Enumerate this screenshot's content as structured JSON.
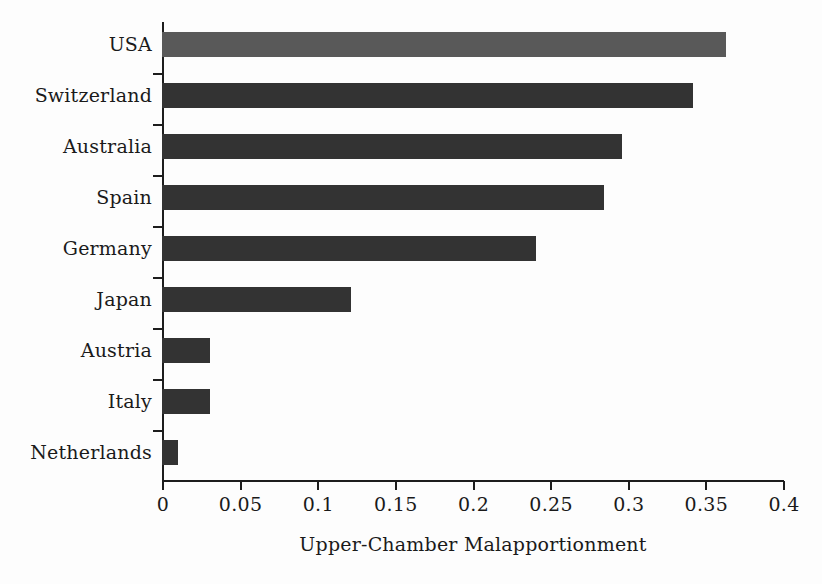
{
  "chart_data": {
    "type": "bar",
    "orientation": "horizontal",
    "title": "",
    "xlabel": "Upper-Chamber Malapportionment",
    "ylabel": "",
    "categories": [
      "USA",
      "Switzerland",
      "Australia",
      "Spain",
      "Germany",
      "Japan",
      "Austria",
      "Italy",
      "Netherlands"
    ],
    "values": [
      0.363,
      0.342,
      0.296,
      0.285,
      0.241,
      0.122,
      0.031,
      0.031,
      0.01
    ],
    "series": [
      {
        "name": "Upper-Chamber Malapportionment",
        "values": [
          0.363,
          0.342,
          0.296,
          0.285,
          0.241,
          0.122,
          0.031,
          0.031,
          0.01
        ]
      }
    ],
    "xlim": [
      0,
      0.4
    ],
    "xticks": [
      0,
      0.05,
      0.1,
      0.15,
      0.2,
      0.25,
      0.3,
      0.35,
      0.4
    ],
    "xticklabels": [
      "0",
      "0.05",
      "0.1",
      "0.15",
      "0.2",
      "0.25",
      "0.3",
      "0.35",
      "0.4"
    ],
    "grid": false,
    "legend": false,
    "bar_colors": [
      "#595959",
      "#333333",
      "#333333",
      "#333333",
      "#333333",
      "#333333",
      "#333333",
      "#333333",
      "#333333"
    ],
    "highlight_category": "USA",
    "colors": {
      "default_bar": "#333333",
      "highlight_bar": "#595959",
      "axis": "#1d1d1d",
      "text": "#1a1a1a",
      "background": "#fdfdfd"
    }
  }
}
